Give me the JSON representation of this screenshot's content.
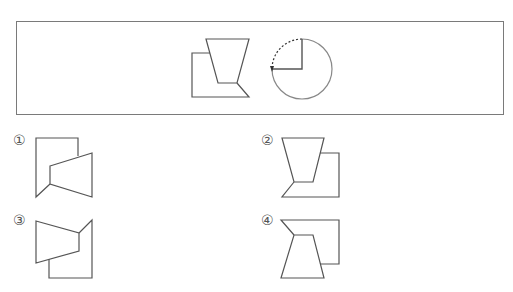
{
  "question": {
    "figure": {
      "description": "Trapezoid overlapping a square, to be rotated as indicated",
      "rotation_indicator": {
        "description": "Circle with quarter arc dashed from top to left, arrow pointing counter-clockwise",
        "direction": "counter-clockwise",
        "angle_degrees": 90
      }
    }
  },
  "options": [
    {
      "number": "1",
      "label": "①"
    },
    {
      "number": "2",
      "label": "②"
    },
    {
      "number": "3",
      "label": "③"
    },
    {
      "number": "4",
      "label": "④"
    }
  ],
  "colors": {
    "line": "#555555",
    "arc": "#888888",
    "border": "#7a7a7a"
  }
}
